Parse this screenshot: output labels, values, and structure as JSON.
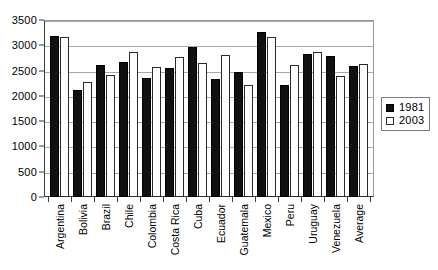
{
  "chart_data": {
    "type": "bar",
    "title": "",
    "xlabel": "",
    "ylabel": "",
    "ylim": [
      0,
      3500
    ],
    "ytick_step": 500,
    "yticks": [
      "0",
      "500",
      "1000",
      "1500",
      "2000",
      "2500",
      "3000",
      "3500"
    ],
    "grid": true,
    "legend_position": "right",
    "categories": [
      "Argentina",
      "Bolivia",
      "Brazil",
      "Chile",
      "Colombia",
      "Costa Rica",
      "Cuba",
      "Ecuador",
      "Guatemala",
      "Mexico",
      "Peru",
      "Uruguay",
      "Venezuela",
      "Average"
    ],
    "series": [
      {
        "name": "1981",
        "color": "#111111",
        "values": [
          3180,
          2120,
          2620,
          2660,
          2350,
          2560,
          2970,
          2340,
          2470,
          3260,
          2220,
          2830,
          2780,
          2600
        ]
      },
      {
        "name": "2003",
        "color": "#ffffff",
        "values": [
          3170,
          2270,
          2410,
          2870,
          2580,
          2770,
          2650,
          2800,
          2210,
          3160,
          2620,
          2860,
          2400,
          2630
        ]
      }
    ]
  },
  "legend": {
    "entries": [
      {
        "label": "1981"
      },
      {
        "label": "2003"
      }
    ]
  }
}
